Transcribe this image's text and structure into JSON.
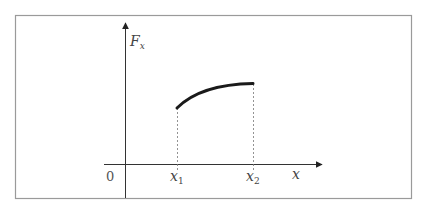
{
  "diagram": {
    "y_axis_label": "F",
    "y_axis_label_sub": "x",
    "x_axis_label": "x",
    "origin_label": "0",
    "x1_label": "x",
    "x1_sub": "1",
    "x2_label": "x",
    "x2_sub": "2",
    "curve": {
      "description": "Concave increasing curve of F_x from x1 to x2",
      "start_value_fraction": 0.6,
      "end_value_fraction": 0.85
    },
    "colors": {
      "border": "#9a9a9a",
      "axis": "#333333",
      "curve": "#1a1a1a",
      "dashed": "#777777"
    }
  }
}
